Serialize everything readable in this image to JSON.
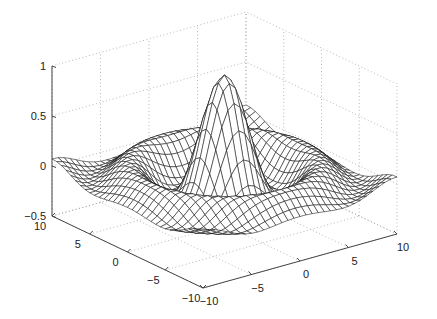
{
  "chart_data": {
    "type": "surface",
    "subtype": "mesh",
    "title": "",
    "function": "z = sin(r)/r, r = sqrt(x^2 + y^2) + eps",
    "x": {
      "label": "",
      "range": [
        -10,
        10
      ],
      "ticks": [
        -10,
        -5,
        0,
        5,
        10
      ],
      "tick_labels": [
        "−10",
        "−5",
        "0",
        "5",
        "10"
      ]
    },
    "y": {
      "label": "",
      "range": [
        -10,
        10
      ],
      "ticks": [
        -10,
        -5,
        0,
        5,
        10
      ],
      "tick_labels": [
        "−10",
        "−5",
        "0",
        "5",
        "10"
      ]
    },
    "z": {
      "label": "",
      "range": [
        -0.5,
        1
      ],
      "ticks": [
        -0.5,
        0,
        0.5,
        1
      ],
      "tick_labels": [
        "−0.5",
        "0",
        "0.5",
        "1"
      ]
    },
    "grid": true,
    "grid_style": "dotted",
    "mesh_resolution": 33,
    "mesh_color": "#111111",
    "face_color": "#ffffff",
    "z_max": 1.0,
    "z_min": -0.217,
    "legend": null
  }
}
